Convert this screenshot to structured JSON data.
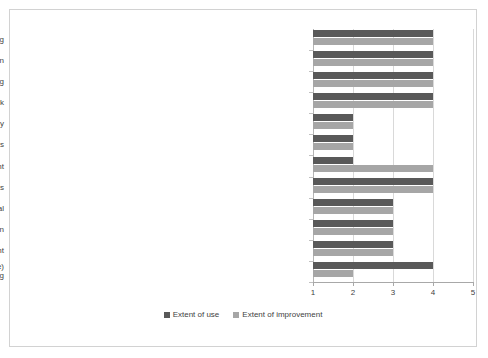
{
  "chart_data": {
    "type": "bar",
    "orientation": "horizontal",
    "title": "",
    "xlabel": "",
    "ylabel": "",
    "xlim": [
      1,
      5
    ],
    "xticks": [
      1,
      2,
      3,
      4,
      5
    ],
    "xtick_labels": [
      "1",
      "2",
      "3",
      "4",
      "5"
    ],
    "grid": true,
    "legend_position": "bottom",
    "categories": [
      "Problem solving",
      "Communication",
      "Networking",
      "Teamwork",
      "Information Technology",
      "Change management techniques",
      "Basic project management",
      "Management of Industrial relations",
      "Techniques for staff appraisal",
      "Techniques for staff motivation",
      "Personnel policy and strategy development",
      "Techniques for human resource needs (current and future)\nforecasting"
    ],
    "series": [
      {
        "name": "Extent of use",
        "color": "#595959",
        "values": [
          4,
          4,
          4,
          4,
          2,
          2,
          2,
          4,
          3,
          3,
          3,
          4
        ]
      },
      {
        "name": "Extent of improvement",
        "color": "#a6a6a6",
        "values": [
          4,
          4,
          4,
          4,
          2,
          2,
          4,
          4,
          3,
          3,
          3,
          2
        ]
      }
    ]
  },
  "legend": {
    "items": [
      {
        "label": "Extent of use"
      },
      {
        "label": "Extent of improvement"
      }
    ]
  }
}
